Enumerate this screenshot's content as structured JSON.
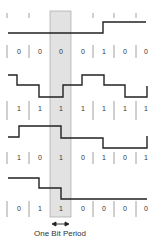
{
  "diagram": {
    "caption": "One Bit Period",
    "highlight_color": "#e2e2e2",
    "line_color": "#222222",
    "tick_color": "#888888",
    "columns": 7,
    "highlighted_column": 2,
    "rows": [
      {
        "bits": [
          "0",
          "0",
          "0",
          "0",
          "1",
          "0",
          "0"
        ],
        "waveform_y_levels": [
          "low",
          "low",
          "low",
          "low",
          "high",
          "high",
          "high"
        ],
        "name": "row-1"
      },
      {
        "bits": [
          "1",
          "1",
          "1",
          "1",
          "1",
          "1",
          "1"
        ],
        "waveform_y_levels": [
          "l1",
          "l2",
          "l3",
          "l2",
          "l1",
          "l2",
          "l3"
        ],
        "name": "row-2"
      },
      {
        "bits": [
          "1",
          "0",
          "1",
          "0",
          "1",
          "0",
          "1"
        ],
        "waveform_y_levels": [
          "mid",
          "high",
          "high",
          "mid",
          "mid",
          "low",
          "low"
        ],
        "name": "row-3"
      },
      {
        "bits": [
          "0",
          "1",
          "1",
          "0",
          "0",
          "0",
          "0"
        ],
        "waveform_y_levels": [
          "high",
          "mid",
          "low",
          "low",
          "low",
          "low",
          "low"
        ],
        "name": "row-4"
      }
    ]
  }
}
